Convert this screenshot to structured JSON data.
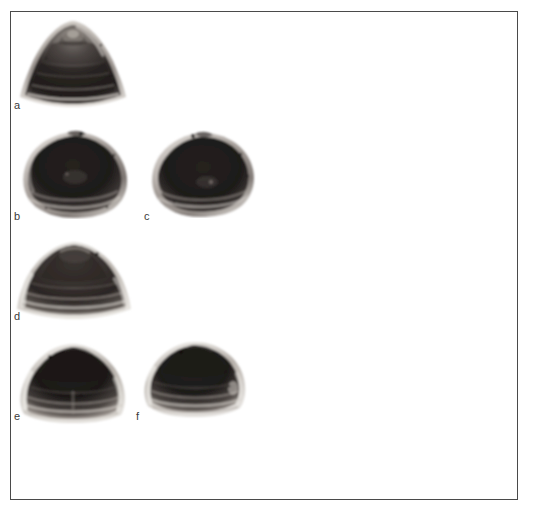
{
  "figure": {
    "type": "photographic-plate",
    "background_color": "#ffffff",
    "frame_color": "#4a4a4a",
    "frame": {
      "x": 10,
      "y": 11,
      "width": 508,
      "height": 489
    },
    "width": 534,
    "height": 523,
    "specimen_count": 6,
    "color_mode": "grayscale"
  },
  "specimens": [
    {
      "id": "a",
      "label": "a",
      "view": "apical-conical",
      "shape": "conical-spire",
      "label_x": 13,
      "label_y": 100,
      "x": 14,
      "y": 16,
      "width": 112,
      "height": 84,
      "shell_dark": "#231f1e",
      "shell_mid": "#5c5653",
      "shell_light": "#d8d4cf"
    },
    {
      "id": "b",
      "label": "b",
      "view": "valve-exterior",
      "shape": "rounded-triangular",
      "label_x": 13,
      "label_y": 211,
      "x": 18,
      "y": 128,
      "width": 110,
      "height": 82,
      "shell_dark": "#201c1b",
      "shell_mid": "#544e4b",
      "shell_light": "#ddd9d4"
    },
    {
      "id": "c",
      "label": "c",
      "view": "valve-exterior",
      "shape": "rounded-ovate",
      "label_x": 144,
      "label_y": 211,
      "x": 148,
      "y": 129,
      "width": 106,
      "height": 80,
      "shell_dark": "#201c1b",
      "shell_mid": "#544e4b",
      "shell_light": "#ddd9d4"
    },
    {
      "id": "d",
      "label": "d",
      "view": "valve-exterior",
      "shape": "broad-conical",
      "label_x": 13,
      "label_y": 311,
      "x": 14,
      "y": 238,
      "width": 112,
      "height": 72,
      "shell_dark": "#2a2523",
      "shell_mid": "#6a6460",
      "shell_light": "#e2ded9"
    },
    {
      "id": "e",
      "label": "e",
      "view": "valve-exterior",
      "shape": "rounded-conical",
      "label_x": 13,
      "label_y": 411,
      "x": 16,
      "y": 340,
      "width": 108,
      "height": 73,
      "shell_dark": "#242020",
      "shell_mid": "#5f5956",
      "shell_light": "#dedad5"
    },
    {
      "id": "f",
      "label": "f",
      "view": "valve-exterior",
      "shape": "low-rounded",
      "label_x": 138,
      "label_y": 411,
      "x": 140,
      "y": 337,
      "width": 104,
      "height": 70,
      "shell_dark": "#242020",
      "shell_mid": "#5f5956",
      "shell_light": "#dedad5"
    }
  ]
}
